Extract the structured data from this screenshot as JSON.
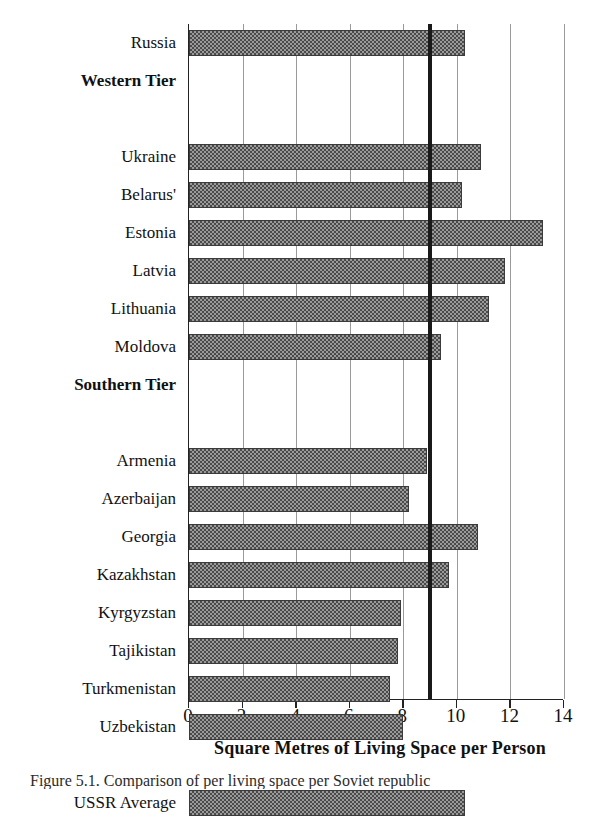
{
  "figure": {
    "axis_title": "Square Metres of Living Space per Person",
    "caption": "Figure 5.1. Comparison of per living space per Soviet republic",
    "bar_fill_color": "#4a4a4a",
    "reference_line_color": "#1a1a1a",
    "gridline_color": "#9a9a9a"
  },
  "chart_data": {
    "type": "bar",
    "orientation": "horizontal",
    "title": "",
    "xlabel": "Square Metres of Living Space per Person",
    "ylabel": "",
    "xlim": [
      0,
      14
    ],
    "xticks": [
      0,
      2,
      4,
      6,
      8,
      10,
      12,
      14
    ],
    "xtick_labels": [
      "0",
      "2",
      "4",
      "6",
      "8",
      "10",
      "12",
      "14"
    ],
    "grid": true,
    "grid_axis": "x",
    "legend": false,
    "reference_line": {
      "value": 9.0,
      "label": ""
    },
    "categories": [
      "Russia",
      "Western Tier",
      "",
      "Ukraine",
      "Belarus'",
      "Estonia",
      "Latvia",
      "Lithuania",
      "Moldova",
      "Southern Tier",
      "",
      "Armenia",
      "Azerbaijan",
      "Georgia",
      "Kazakhstan",
      "Kyrgyzstan",
      "Tajikistan",
      "Turkmenistan",
      "Uzbekistan",
      "",
      "USSR Average"
    ],
    "values": [
      10.3,
      null,
      null,
      10.9,
      10.2,
      13.2,
      11.8,
      11.2,
      9.4,
      null,
      null,
      8.9,
      8.2,
      10.8,
      9.7,
      7.9,
      7.8,
      7.5,
      8.0,
      null,
      10.3
    ],
    "row_types": [
      "bar",
      "header",
      "spacer",
      "bar",
      "bar",
      "bar",
      "bar",
      "bar",
      "bar",
      "header",
      "spacer",
      "bar",
      "bar",
      "bar",
      "bar",
      "bar",
      "bar",
      "bar",
      "bar",
      "spacer",
      "bar"
    ]
  }
}
